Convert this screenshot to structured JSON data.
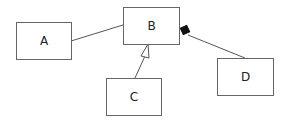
{
  "diagram": {
    "type": "uml-class-diagram",
    "nodes": [
      {
        "id": "A",
        "label": "A"
      },
      {
        "id": "B",
        "label": "B"
      },
      {
        "id": "C",
        "label": "C"
      },
      {
        "id": "D",
        "label": "D"
      }
    ],
    "edges": [
      {
        "from": "A",
        "to": "B",
        "kind": "association"
      },
      {
        "from": "C",
        "to": "B",
        "kind": "generalization"
      },
      {
        "from": "D",
        "to": "B",
        "kind": "composition"
      }
    ]
  }
}
